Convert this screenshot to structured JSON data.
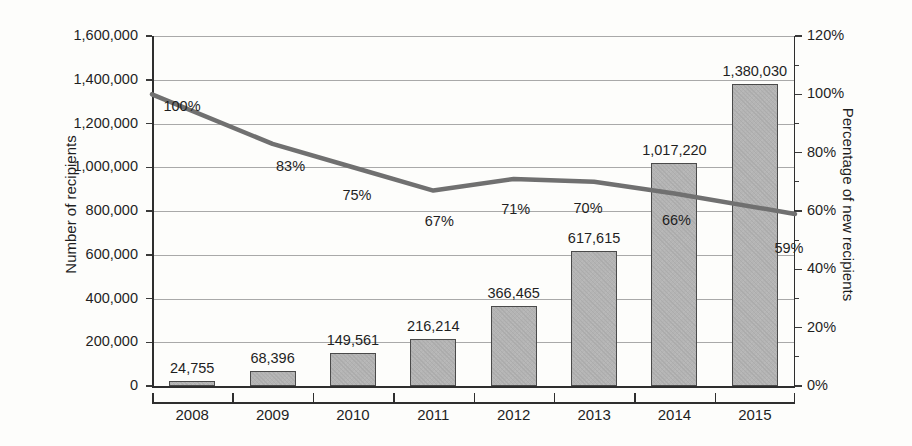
{
  "chart_data": {
    "type": "bar",
    "title": "",
    "subtitle": "",
    "xlabel": "",
    "ylabel": "Number of recipients",
    "y2label": "Percentage of new recipients",
    "categories": [
      "2008",
      "2009",
      "2010",
      "2011",
      "2012",
      "2013",
      "2014",
      "2015"
    ],
    "series": [
      {
        "name": "Number of recipients",
        "type": "bar",
        "axis": "left",
        "values": [
          24755,
          68396,
          149561,
          216214,
          366465,
          617615,
          1017220,
          1380030
        ],
        "value_labels": [
          "24,755",
          "68,396",
          "149,561",
          "216,214",
          "366,465",
          "617,615",
          "1,017,220",
          "1,380,030"
        ],
        "color": "#b4b4b4",
        "border_color": "#4a4a4a"
      },
      {
        "name": "Percentage of new recipients",
        "type": "line",
        "axis": "right",
        "values": [
          100,
          83,
          75,
          67,
          71,
          70,
          66,
          59
        ],
        "value_labels": [
          "100%",
          "83%",
          "75%",
          "67%",
          "71%",
          "70%",
          "66%",
          "59%"
        ],
        "color": "#707070"
      }
    ],
    "ylim": [
      0,
      1600000
    ],
    "y2lim": [
      0,
      120
    ],
    "yticks": [
      0,
      200000,
      400000,
      600000,
      800000,
      1000000,
      1200000,
      1400000,
      1600000
    ],
    "ytick_labels": [
      "0",
      "200,000",
      "400,000",
      "600,000",
      "800,000",
      "1,000,000",
      "1,200,000",
      "1,400,000",
      "1,600,000"
    ],
    "y2ticks": [
      0,
      20,
      40,
      60,
      80,
      100,
      120
    ],
    "y2tick_labels": [
      "0%",
      "20%",
      "40%",
      "60%",
      "80%",
      "100%",
      "120%"
    ],
    "y2_minor_ticks": [
      10,
      30,
      50,
      70,
      90,
      110
    ],
    "grid": true,
    "legend": "none"
  },
  "colors": {
    "background": "#fdfdfb",
    "grid": "#a9a9a9",
    "axis": "#2e2e2e",
    "text": "#1f1f1f",
    "bar_fill": "#b4b4b4",
    "bar_stroke": "#4a4a4a",
    "line": "#707070"
  }
}
